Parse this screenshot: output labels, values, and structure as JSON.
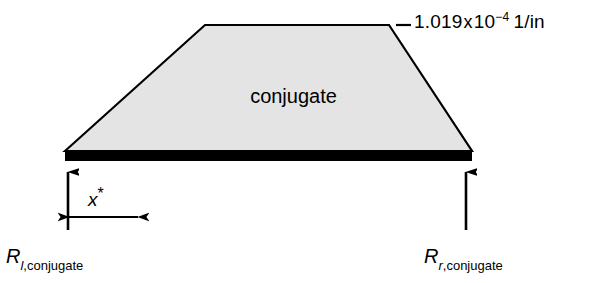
{
  "figure": {
    "type": "beam-loading-diagram",
    "background_color": "#ffffff",
    "shape_fill_color": "#e4e4e4",
    "shape_stroke_color": "#000000",
    "base_bar_color": "#000000"
  },
  "labels": {
    "load_intensity": {
      "leader_dash": "—",
      "value": "1.019",
      "multiply": "x",
      "base": "10",
      "exponent": "−4",
      "unit": "1/in"
    },
    "region": "conjugate",
    "dimension": {
      "symbol": "x",
      "marker": "*"
    },
    "reaction_left": {
      "symbol": "R",
      "subscript_italic": "l",
      "subscript_rest": ",conjugate"
    },
    "reaction_right": {
      "symbol": "R",
      "subscript_italic": "r",
      "subscript_rest": ",conjugate"
    }
  },
  "geometry": {
    "trapezoid": {
      "bottom_left_x": 65,
      "bottom_right_x": 472,
      "top_left_x": 205,
      "top_right_x": 389,
      "top_y": 25,
      "bottom_y": 150
    },
    "base_bar": {
      "x": 65,
      "y": 150,
      "width": 407,
      "height": 11
    },
    "reaction_arrow_left_x": 68,
    "reaction_arrow_right_x": 466,
    "reaction_arrow_top_y": 170,
    "reaction_arrow_bottom_y": 230,
    "dimension_arrow_y": 217,
    "dimension_arrow_x1": 68,
    "dimension_arrow_x2": 139,
    "leader_line_x1": 396,
    "leader_line_x2": 411,
    "leader_line_y": 25
  }
}
